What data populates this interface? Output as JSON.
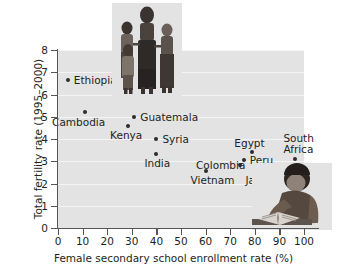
{
  "chart_data": {
    "type": "scatter",
    "title": "",
    "xlabel": "Female secondary school enrollment rate (%)",
    "ylabel": "Total fertility rate (1995–2000)",
    "xlim": [
      0,
      100
    ],
    "ylim": [
      0,
      8
    ],
    "xticks": [
      "0",
      "10",
      "20",
      "30",
      "40",
      "50",
      "60",
      "70",
      "80",
      "90",
      "100"
    ],
    "yticks": [
      "0",
      "1",
      "2",
      "3",
      "4",
      "5",
      "6",
      "7",
      "8"
    ],
    "grid": "horizontal",
    "legend": "none",
    "points": [
      {
        "label": "Ethiopia",
        "x": 4,
        "y": 6.65,
        "label_dx": 6,
        "label_dy": -5
      },
      {
        "label": "Cambodia",
        "x": 11,
        "y": 5.2,
        "label_dx": -33,
        "label_dy": 5
      },
      {
        "label": "Guatemala",
        "x": 31,
        "y": 5.0,
        "label_dx": 6,
        "label_dy": -5
      },
      {
        "label": "Kenya",
        "x": 28.5,
        "y": 4.6,
        "label_dx": -18,
        "label_dy": 4
      },
      {
        "label": "Syria",
        "x": 40,
        "y": 4.0,
        "label_dx": 6,
        "label_dy": -5
      },
      {
        "label": "India",
        "x": 40,
        "y": 3.33,
        "label_dx": -12,
        "label_dy": 4
      },
      {
        "label": "Egypt",
        "x": 79,
        "y": 3.42,
        "label_dx": -18,
        "label_dy": -14
      },
      {
        "label": "Peru",
        "x": 75.5,
        "y": 3.05,
        "label_dx": 6,
        "label_dy": -5
      },
      {
        "label": "Colombia",
        "x": 74,
        "y": 2.82,
        "label_dx": -44,
        "label_dy": -5
      },
      {
        "label": "Vietnam",
        "x": 60,
        "y": 2.55,
        "label_dx": -15,
        "label_dy": 4
      },
      {
        "label": "Jamaica",
        "x": 83.5,
        "y": 2.55,
        "label_dx": -18,
        "label_dy": 4
      },
      {
        "label": "South\nAfrica",
        "x": 96.5,
        "y": 3.1,
        "label_dx": -12,
        "label_dy": -26
      }
    ]
  },
  "photos": {
    "family": "family-photo",
    "reader": "reading-student-photo"
  },
  "colors": {
    "plot_background": "#e3e3e3",
    "gridline": "#f4f4f4",
    "axis": "#555555",
    "point": "#2b2b2b",
    "text": "#231f20"
  }
}
